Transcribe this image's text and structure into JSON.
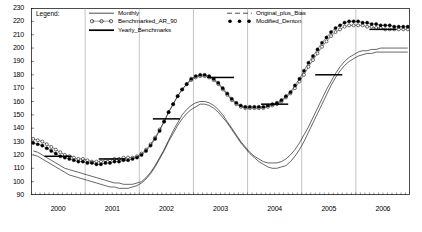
{
  "chart_data": {
    "type": "line",
    "title": "",
    "xlabel": "",
    "ylabel": "",
    "ylim": [
      90,
      230
    ],
    "ytick_step": 10,
    "yticks": [
      90,
      100,
      110,
      120,
      130,
      140,
      150,
      160,
      170,
      180,
      190,
      200,
      210,
      220,
      230
    ],
    "xticks": [
      "2000",
      "2001",
      "2002",
      "2003",
      "2004",
      "2005",
      "2006"
    ],
    "x_range": [
      "2000-01",
      "2006-12"
    ],
    "x_minor_ticks": "monthly",
    "grid": "vertical-year-lines",
    "legend_position": "top-left-inside",
    "series": [
      {
        "name": "Monthly",
        "style": "thin-solid-line",
        "color": "#000000",
        "values": [
          123,
          122,
          120,
          118,
          116,
          114,
          112,
          110,
          109,
          108,
          107,
          106,
          105,
          104,
          103,
          102,
          101,
          100,
          99,
          99,
          98,
          98,
          98,
          99,
          100,
          103,
          107,
          112,
          118,
          124,
          131,
          138,
          144,
          150,
          154,
          157,
          159,
          160,
          160,
          159,
          157,
          154,
          150,
          145,
          140,
          135,
          130,
          126,
          122,
          119,
          117,
          115,
          114,
          114,
          114,
          115,
          117,
          120,
          124,
          129,
          135,
          141,
          148,
          155,
          162,
          169,
          175,
          181,
          186,
          190,
          193,
          195,
          197,
          198,
          198,
          199,
          199,
          200,
          200,
          200,
          200,
          200,
          200,
          200
        ]
      },
      {
        "name": "Benchmarked_AR_90",
        "style": "open-circle-markers",
        "color": "#000000",
        "values": [
          132,
          131,
          130,
          128,
          126,
          124,
          122,
          120,
          119,
          118,
          117,
          117,
          116,
          115,
          115,
          115,
          116,
          116,
          117,
          117,
          118,
          118,
          118,
          119,
          121,
          124,
          128,
          133,
          139,
          145,
          152,
          158,
          164,
          169,
          173,
          176,
          178,
          179,
          179,
          178,
          176,
          173,
          169,
          165,
          161,
          158,
          156,
          155,
          155,
          155,
          155,
          155,
          156,
          157,
          158,
          160,
          163,
          166,
          170,
          175,
          180,
          186,
          191,
          196,
          201,
          205,
          209,
          212,
          214,
          216,
          217,
          217,
          217,
          217,
          216,
          216,
          215,
          215,
          214,
          214,
          214,
          214,
          214,
          214
        ]
      },
      {
        "name": "Yearly_Benchmarks",
        "style": "thick-horizontal-step-lines",
        "color": "#000000",
        "values": [
          119,
          117,
          147,
          178,
          158,
          180,
          214
        ],
        "years": [
          "2000",
          "2001",
          "2002",
          "2003",
          "2004",
          "2005",
          "2006"
        ]
      },
      {
        "name": "Original_plus_Bias",
        "style": "thin-dashed-line",
        "color": "#000000",
        "values": [
          120,
          119,
          117,
          115,
          113,
          111,
          109,
          107,
          105,
          104,
          103,
          102,
          101,
          100,
          99,
          98,
          97,
          96,
          96,
          95,
          95,
          95,
          96,
          97,
          99,
          102,
          106,
          111,
          117,
          123,
          130,
          136,
          142,
          147,
          151,
          154,
          156,
          158,
          158,
          157,
          155,
          152,
          148,
          144,
          139,
          134,
          129,
          125,
          121,
          118,
          115,
          113,
          111,
          110,
          110,
          111,
          112,
          115,
          119,
          124,
          130,
          137,
          144,
          151,
          158,
          165,
          172,
          178,
          183,
          187,
          190,
          192,
          194,
          195,
          196,
          196,
          197,
          197,
          197,
          197,
          197,
          197,
          197,
          197
        ]
      },
      {
        "name": "Modified_Denton",
        "style": "filled-circle-markers",
        "color": "#000000",
        "values": [
          129,
          128,
          127,
          125,
          123,
          121,
          119,
          118,
          117,
          116,
          115,
          115,
          114,
          114,
          113,
          113,
          114,
          114,
          115,
          115,
          116,
          116,
          117,
          118,
          120,
          123,
          127,
          132,
          138,
          145,
          152,
          158,
          164,
          169,
          173,
          177,
          179,
          180,
          180,
          179,
          177,
          174,
          170,
          166,
          162,
          159,
          157,
          156,
          156,
          156,
          156,
          156,
          157,
          158,
          159,
          161,
          164,
          167,
          172,
          177,
          183,
          189,
          194,
          199,
          204,
          208,
          212,
          215,
          217,
          219,
          220,
          220,
          220,
          219,
          219,
          218,
          218,
          217,
          217,
          217,
          216,
          216,
          216,
          216
        ]
      }
    ],
    "legend": {
      "title": "Legend:",
      "entries": [
        {
          "label": "Monthly",
          "key": "line"
        },
        {
          "label": "Benchmarked_AR_90",
          "key": "open-circles"
        },
        {
          "label": "Yearly_Benchmarks",
          "key": "thick-line"
        },
        {
          "label": "Original_plus_Bias",
          "key": "dashed-line"
        },
        {
          "label": "Modified_Denton",
          "key": "filled-circles"
        }
      ]
    }
  }
}
